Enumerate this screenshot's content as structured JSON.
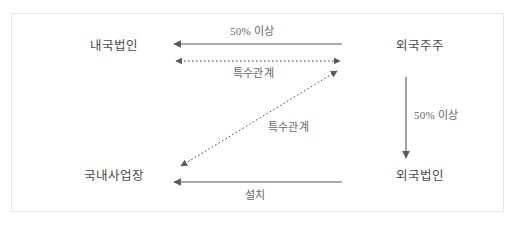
{
  "diagram": {
    "type": "relationship-diagram",
    "frame": {
      "border_color": "#e6e6e6",
      "background": "#ffffff"
    },
    "line_color": "#5a5a5a",
    "text_color": "#4a4a4a",
    "label_color": "#666666",
    "nodes": [
      {
        "id": "domestic-corp",
        "label": "내국법인",
        "position": "top-left"
      },
      {
        "id": "foreign-holder",
        "label": "외국주주",
        "position": "top-right"
      },
      {
        "id": "domestic-pe",
        "label": "국내사업장",
        "position": "bottom-left"
      },
      {
        "id": "foreign-corp",
        "label": "외국법인",
        "position": "bottom-right"
      }
    ],
    "edges": [
      {
        "id": "top-ownership",
        "label": "50% 이상",
        "from": "foreign-holder",
        "to": "domestic-corp",
        "style": "solid",
        "arrow": "single-left"
      },
      {
        "id": "top-relation",
        "label": "특수관계",
        "from": "domestic-corp",
        "to": "foreign-holder",
        "style": "dotted",
        "arrow": "double"
      },
      {
        "id": "diagonal-relation",
        "label": "특수관계",
        "from": "domestic-pe",
        "to": "foreign-holder",
        "style": "dotted",
        "arrow": "double"
      },
      {
        "id": "right-ownership",
        "label": "50% 이상",
        "from": "foreign-holder",
        "to": "foreign-corp",
        "style": "solid",
        "arrow": "single-down"
      },
      {
        "id": "bottom-install",
        "label": "설치",
        "from": "foreign-corp",
        "to": "domestic-pe",
        "style": "solid",
        "arrow": "single-left"
      }
    ]
  }
}
